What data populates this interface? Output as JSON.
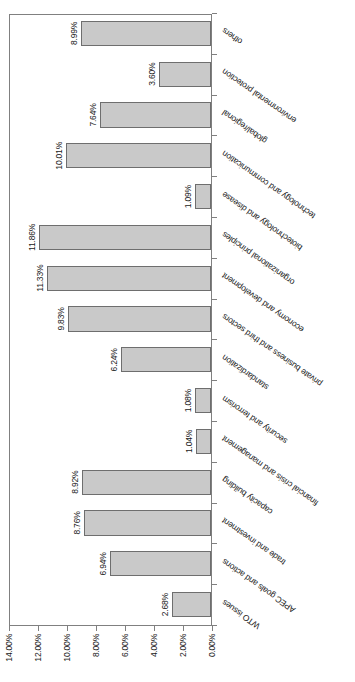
{
  "chart_data": {
    "type": "bar",
    "orientation": "vertical",
    "title": "",
    "subtitle": "",
    "xlabel": "",
    "ylabel": "",
    "ylim": [
      0,
      14
    ],
    "ytick_values": [
      0,
      2,
      4,
      6,
      8,
      10,
      12,
      14
    ],
    "ytick_labels": [
      "0.00%",
      "2.00%",
      "4.00%",
      "6.00%",
      "8.00%",
      "10.00%",
      "12.00%",
      "14.00%"
    ],
    "grid": false,
    "legend": false,
    "legend_position": "none",
    "value_suffix": "%",
    "categories": [
      "WTO issues",
      "APEC goals and actions",
      "trade and investment",
      "capacity building",
      "financial crisis and management",
      "security and terrorism",
      "standardization",
      "private business and third sectors",
      "economy and development",
      "organizational principles",
      "biotechnology and disease",
      "technology and communication",
      "global/regional",
      "environmental protection",
      "others"
    ],
    "values": [
      2.68,
      6.94,
      8.76,
      8.92,
      1.04,
      1.08,
      6.24,
      9.83,
      11.33,
      11.86,
      1.09,
      10.01,
      7.64,
      3.6,
      8.99
    ],
    "data_labels": [
      "2.68%",
      "6.94%",
      "8.76%",
      "8.92%",
      "1.04%",
      "1.08%",
      "6.24%",
      "9.83%",
      "11.33%",
      "11.86%",
      "1.09%",
      "10.01%",
      "7.64%",
      "3.60%",
      "8.99%"
    ],
    "bar_fill_color": "#c9c9c9",
    "bar_border_color": "#6e6e6e",
    "axis_color": "#808080",
    "text_color": "#1a1a1a",
    "background_color": "#ffffff"
  }
}
